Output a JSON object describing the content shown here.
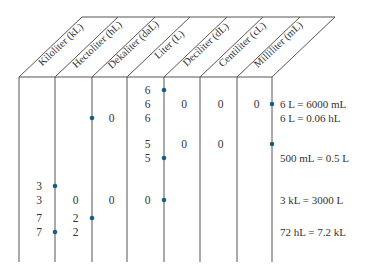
{
  "colors": {
    "line": "#555555",
    "dot": "#1a5f80",
    "text": "#333333"
  },
  "columns": [
    {
      "key": "kL",
      "label": "Kiloliter (kL)"
    },
    {
      "key": "hL",
      "label": "Hectoliter (hL)"
    },
    {
      "key": "daL",
      "label": "Dekaliter (daL)"
    },
    {
      "key": "L",
      "label": "Liter (L)"
    },
    {
      "key": "dL",
      "label": "Deciliter (dL)"
    },
    {
      "key": "cL",
      "label": "Centiliter (cL)"
    },
    {
      "key": "mL",
      "label": "Milliliter (mL)"
    }
  ],
  "rows": [
    {
      "cells": [
        "",
        "",
        "",
        "6",
        "",
        "",
        ""
      ],
      "dot_after_col": 3,
      "note": ""
    },
    {
      "cells": [
        "",
        "",
        "",
        "6",
        "0",
        "0",
        "0"
      ],
      "dot_after_col": 6,
      "note": "6 L = 6000 mL"
    },
    {
      "cells": [
        "",
        "",
        "0",
        "6",
        "",
        "",
        ""
      ],
      "dot_after_col": 1,
      "note": "6 L = 0.06 hL"
    },
    {
      "cells": [
        "",
        "",
        "",
        "5",
        "0",
        "0",
        ""
      ],
      "dot_after_col": 6,
      "note": ""
    },
    {
      "cells": [
        "",
        "",
        "",
        "5",
        "",
        "",
        ""
      ],
      "dot_after_col": 3,
      "note": "500 mL = 0.5 L"
    },
    {
      "cells": [
        "3",
        "",
        "",
        "",
        "",
        "",
        ""
      ],
      "dot_after_col": 0,
      "note": ""
    },
    {
      "cells": [
        "3",
        "0",
        "0",
        "0",
        "",
        "",
        ""
      ],
      "dot_after_col": 3,
      "note": "3 kL = 3000 L"
    },
    {
      "cells": [
        "7",
        "2",
        "",
        "",
        "",
        "",
        ""
      ],
      "dot_after_col": 1,
      "note": ""
    },
    {
      "cells": [
        "7",
        "2",
        "",
        "",
        "",
        "",
        ""
      ],
      "dot_after_col": 0,
      "note": "72 hL = 7.2 kL"
    }
  ]
}
